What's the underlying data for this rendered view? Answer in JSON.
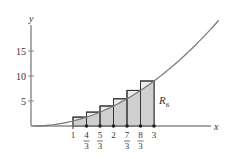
{
  "figure": {
    "y_axis_label": "y",
    "x_axis_label": "x",
    "region_label": "R",
    "region_subscript": "6",
    "y_ticks": [
      {
        "value": 5,
        "label": "5"
      },
      {
        "value": 10,
        "label": "10"
      },
      {
        "value": 15,
        "label": "15"
      }
    ],
    "x_ticks": [
      {
        "value": 1,
        "num": "1",
        "den": ""
      },
      {
        "value": 1.3333,
        "num": "4",
        "den": "3"
      },
      {
        "value": 1.6667,
        "num": "5",
        "den": "3"
      },
      {
        "value": 2,
        "num": "2",
        "den": ""
      },
      {
        "value": 2.3333,
        "num": "7",
        "den": "3"
      },
      {
        "value": 2.6667,
        "num": "8",
        "den": "3"
      },
      {
        "value": 3,
        "num": "3",
        "den": ""
      }
    ],
    "colors": {
      "fill": "#cfcfcf",
      "curve": "#777777",
      "axis": "#888888",
      "rect_stroke": "#333333"
    }
  },
  "chart_data": {
    "type": "area",
    "function": "x^2",
    "interval": [
      1,
      3
    ],
    "n": 6,
    "partition": [
      1,
      1.3333,
      1.6667,
      2,
      2.3333,
      2.6667,
      3
    ],
    "rectangle_heights": [
      1.78,
      2.78,
      4.0,
      5.44,
      7.11,
      9.0
    ],
    "xlabel": "x",
    "ylabel": "y",
    "ylim": [
      0,
      20
    ],
    "xlim": [
      0,
      4.7
    ],
    "annotations": [
      "R6"
    ]
  }
}
